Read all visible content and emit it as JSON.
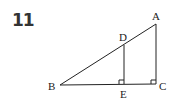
{
  "problem": {
    "number": "11"
  },
  "diagram": {
    "points": {
      "A": {
        "label": "A",
        "x": 156,
        "y": 24
      },
      "B": {
        "label": "B",
        "x": 60,
        "y": 85
      },
      "C": {
        "label": "C",
        "x": 156,
        "y": 84
      },
      "D": {
        "label": "D",
        "x": 124,
        "y": 45
      },
      "E": {
        "label": "E",
        "x": 124,
        "y": 84
      }
    },
    "segments": [
      "AB",
      "BC",
      "AC",
      "DE"
    ],
    "right_angles": [
      "E",
      "C"
    ],
    "stroke_color": "#222222"
  }
}
